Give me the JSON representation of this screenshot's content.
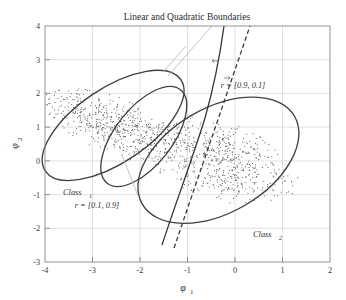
{
  "chart_data": {
    "type": "scatter",
    "title": "Linear and Quadratic Boundaries",
    "xlabel": "φ",
    "xlabel_sub": "1",
    "ylabel": "φ",
    "ylabel_sub": "2",
    "xlim": [
      -4,
      2
    ],
    "ylim": [
      -3,
      4
    ],
    "xticks": [
      -4,
      -3,
      -2,
      -1,
      0,
      1,
      2
    ],
    "yticks": [
      -3,
      -2,
      -1,
      0,
      1,
      2,
      3,
      4
    ],
    "xtick_labels": [
      "-4",
      "-3",
      "-2",
      "-1",
      "0",
      "1",
      "2"
    ],
    "ytick_labels": [
      "-3",
      "-2",
      "-1",
      "0",
      "1",
      "2",
      "3",
      "4"
    ],
    "grid": true,
    "legend_position": "none",
    "series": [
      {
        "name": "Class 1",
        "marker": "dot",
        "color": "#555555",
        "n_points": 600,
        "center": [
          -2.55,
          1.05
        ],
        "semi_major": 1.72,
        "semi_minor": 0.78,
        "angle_deg": -34
      },
      {
        "name": "Class 2",
        "marker": "dot",
        "color": "#555555",
        "n_points": 700,
        "center": [
          -0.35,
          0.02
        ],
        "semi_major": 1.85,
        "semi_minor": 1.1,
        "angle_deg": -30
      }
    ],
    "boundaries": [
      {
        "name": "quadratic-boundary",
        "style": "solid",
        "description": "curved quadratic decision boundary"
      },
      {
        "name": "linear-boundary",
        "style": "dashed",
        "description": "straight linear decision boundary"
      }
    ],
    "contours": [
      {
        "name": "class1-contour",
        "center": [
          -2.55,
          1.05
        ],
        "semi_major": 1.72,
        "semi_minor": 0.78,
        "angle_deg": -34
      },
      {
        "name": "class2-contour",
        "center": [
          -0.35,
          0.02
        ],
        "semi_major": 1.85,
        "semi_minor": 1.1,
        "angle_deg": -30
      },
      {
        "name": "inner-contour",
        "center": [
          -1.92,
          0.72
        ],
        "semi_major": 1.25,
        "semi_minor": 0.6,
        "angle_deg": -52
      }
    ],
    "annotations": [
      {
        "name": "class1-label",
        "text": "Class",
        "sub": "1",
        "x": -3.22,
        "y": -1.02
      },
      {
        "name": "class2-label",
        "text": "Class",
        "sub": "2",
        "x": 0.52,
        "y": -2.28
      },
      {
        "name": "ratio-upper-label",
        "text": "r = [0.9, 0.1]",
        "x": -0.72,
        "y": 2.28
      },
      {
        "name": "ratio-lower-label",
        "text": "r = [0.1, 0.9]",
        "x": -3.58,
        "y": -1.92
      }
    ]
  }
}
